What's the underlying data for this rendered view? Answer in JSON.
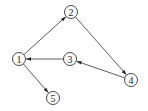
{
  "graph": {
    "type": "directed",
    "nodes": [
      {
        "id": "1",
        "label": "1",
        "x": 19,
        "y": 59
      },
      {
        "id": "2",
        "label": "2",
        "x": 71,
        "y": 12
      },
      {
        "id": "3",
        "label": "3",
        "x": 70,
        "y": 59
      },
      {
        "id": "4",
        "label": "4",
        "x": 131,
        "y": 80
      },
      {
        "id": "5",
        "label": "5",
        "x": 53,
        "y": 98
      }
    ],
    "edges": [
      {
        "from": "1",
        "to": "2"
      },
      {
        "from": "2",
        "to": "4"
      },
      {
        "from": "4",
        "to": "3"
      },
      {
        "from": "3",
        "to": "1"
      },
      {
        "from": "1",
        "to": "5"
      }
    ],
    "node_radius": 6.5,
    "stroke_color": "#333333"
  }
}
